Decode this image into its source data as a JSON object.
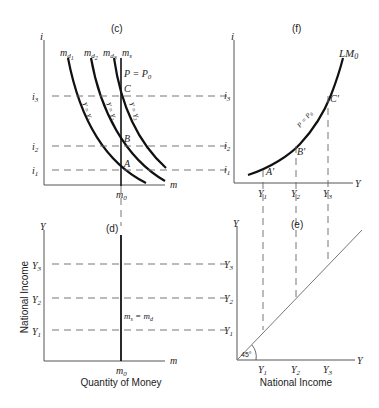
{
  "panels": {
    "c": {
      "title": "(c)",
      "y_axis_label": "i",
      "x_axis_label": "m",
      "x_tick": "m",
      "x_tick_sub": "0",
      "y_ticks": [
        {
          "label": "i",
          "sub": "3"
        },
        {
          "label": "i",
          "sub": "2"
        },
        {
          "label": "i",
          "sub": "1"
        }
      ],
      "curves": [
        {
          "label": "m",
          "sub": "d",
          "subsub": "1",
          "param": "Y = Y",
          "param_sub": "1"
        },
        {
          "label": "m",
          "sub": "d",
          "subsub": "2",
          "param": "Y = Y",
          "param_sub": "2"
        },
        {
          "label": "m",
          "sub": "d",
          "subsub": "3",
          "param": "Y = Y",
          "param_sub": "3"
        }
      ],
      "supply_label": "m",
      "supply_sub": "s",
      "price_label": "P = P",
      "price_sub": "0",
      "points": [
        "C",
        "B",
        "A"
      ]
    },
    "f": {
      "title": "(f)",
      "y_axis_label": "i",
      "x_axis_label": "Y",
      "curve_label": "LM",
      "curve_sub": "0",
      "curve_param": "P = P",
      "curve_param_sub": "0",
      "y_ticks": [
        {
          "label": "i",
          "sub": "3"
        },
        {
          "label": "i",
          "sub": "2"
        },
        {
          "label": "i",
          "sub": "1"
        }
      ],
      "x_ticks": [
        {
          "label": "Y",
          "sub": "1"
        },
        {
          "label": "Y",
          "sub": "2"
        },
        {
          "label": "Y",
          "sub": "3"
        }
      ],
      "points": [
        "A'",
        "B'",
        "C'"
      ]
    },
    "d": {
      "title": "(d)",
      "y_axis_label": "Y",
      "x_axis_label": "m",
      "y_axis_title": "National Income",
      "x_axis_title": "Quantity of Money",
      "x_tick": "m",
      "x_tick_sub": "0",
      "y_ticks": [
        {
          "label": "Y",
          "sub": "3"
        },
        {
          "label": "Y",
          "sub": "2"
        },
        {
          "label": "Y",
          "sub": "1"
        }
      ],
      "line_label_left": "m",
      "line_label_left_sub": "s",
      "line_label_eq": " = ",
      "line_label_right": "m",
      "line_label_right_sub": "d"
    },
    "e": {
      "title": "(e)",
      "y_axis_label": "Y",
      "x_axis_label": "Y",
      "x_axis_title": "National Income",
      "angle_label": "45°",
      "y_ticks": [
        {
          "label": "Y",
          "sub": "3"
        },
        {
          "label": "Y",
          "sub": "2"
        },
        {
          "label": "Y",
          "sub": "1"
        }
      ],
      "x_ticks": [
        {
          "label": "Y",
          "sub": "1"
        },
        {
          "label": "Y",
          "sub": "2"
        },
        {
          "label": "Y",
          "sub": "3"
        }
      ]
    }
  }
}
